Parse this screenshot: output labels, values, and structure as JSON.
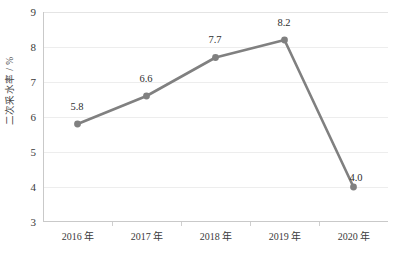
{
  "chart_data": {
    "type": "line",
    "title": "",
    "xlabel": "",
    "ylabel": "二次采水率 / %",
    "categories": [
      "2016 年",
      "2017 年",
      "2018 年",
      "2019 年",
      "2020 年"
    ],
    "values": [
      5.8,
      6.6,
      7.7,
      8.2,
      4.0
    ],
    "point_labels": [
      "5.8",
      "6.6",
      "7.7",
      "8.2",
      "4.0"
    ],
    "ylim": [
      3,
      9
    ],
    "yticks": [
      3,
      4,
      5,
      6,
      7,
      8,
      9
    ],
    "ytick_labels": [
      "3",
      "4",
      "5",
      "6",
      "7",
      "8",
      "9"
    ],
    "grid": "horizontal",
    "legend": "none",
    "series": [
      {
        "name": "二次采水率",
        "values": [
          5.8,
          6.6,
          7.7,
          8.2,
          4.0
        ],
        "line_color": "#808080",
        "marker_color": "#808080",
        "marker": "circle"
      }
    ]
  },
  "axis": {
    "y_title": "二次采水率 / %",
    "y_tick_0": "3",
    "y_tick_1": "4",
    "y_tick_2": "5",
    "y_tick_3": "6",
    "y_tick_4": "7",
    "y_tick_5": "8",
    "y_tick_6": "9"
  },
  "x_labels": {
    "l0": "2016 年",
    "l1": "2017 年",
    "l2": "2018 年",
    "l3": "2019 年",
    "l4": "2020 年"
  },
  "data_labels": {
    "p0": "5.8",
    "p1": "6.6",
    "p2": "7.7",
    "p3": "8.2",
    "p4": "4.0"
  },
  "colors": {
    "line": "#808080",
    "marker": "#808080",
    "grid": "#ededed",
    "axis": "#c9c9c9",
    "text": "#3a3a3a",
    "background": "#ffffff"
  }
}
